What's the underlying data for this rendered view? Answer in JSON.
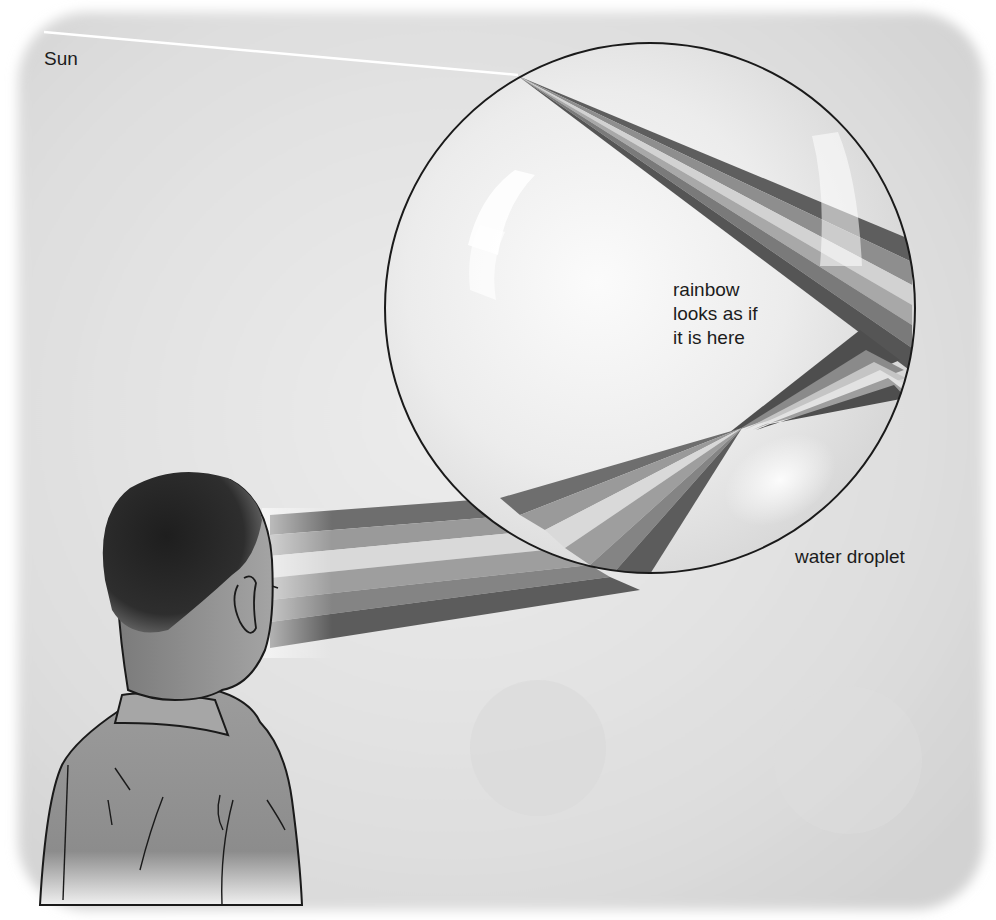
{
  "figure": {
    "labels": {
      "sun": "Sun",
      "rainbow_lines": [
        "rainbow",
        "looks as if",
        "it is here"
      ],
      "droplet": "water droplet"
    },
    "elements": {
      "sun_ray": "white incoming sunlight ray from top-left",
      "droplet": "large circular water droplet with highlights",
      "refracted_band": "light splits into colour bands inside droplet",
      "reflection_point": "bands reflect off back of droplet",
      "exit_band": "bands cross and exit toward observer",
      "observer": "boy seen from behind looking at droplet"
    },
    "colors": {
      "background": "#e2e2e2",
      "droplet_fill": "#ededed",
      "outline": "#1a1a1a",
      "band_dark": "#5a5a5a",
      "band_mid": "#8a8a8a",
      "band_light": "#c8c8c8",
      "band_lightest": "#e6e6e6",
      "hair": "#2b2b2b",
      "skin": "#8f8f8f",
      "shirt": "#9a9a9a"
    }
  }
}
